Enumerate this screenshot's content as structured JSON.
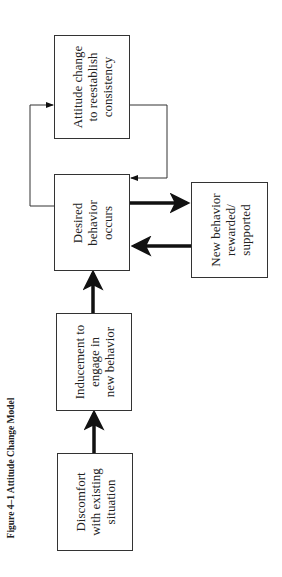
{
  "caption": "Figure 4–1  Attitude Change Model",
  "nodes": {
    "discomfort": {
      "lines": [
        "Discomfort",
        "with existing",
        "situation"
      ]
    },
    "inducement": {
      "lines": [
        "Inducement to",
        "engage in",
        "new behavior"
      ]
    },
    "desired": {
      "lines": [
        "Desired",
        "behavior",
        "occurs"
      ]
    },
    "reward": {
      "lines": [
        "New behavior",
        "rewarded/",
        "supported"
      ]
    },
    "attitude": {
      "lines": [
        "Attitude change",
        "to reestablish",
        "consistency"
      ]
    }
  },
  "edges": [
    {
      "from": "discomfort",
      "to": "inducement",
      "style": "thick"
    },
    {
      "from": "inducement",
      "to": "desired",
      "style": "thick"
    },
    {
      "from": "desired",
      "to": "reward",
      "style": "thick"
    },
    {
      "from": "reward",
      "to": "desired",
      "style": "thick"
    },
    {
      "from": "desired",
      "to": "attitude",
      "style": "thin"
    },
    {
      "from": "attitude",
      "to": "desired",
      "style": "thin"
    }
  ]
}
